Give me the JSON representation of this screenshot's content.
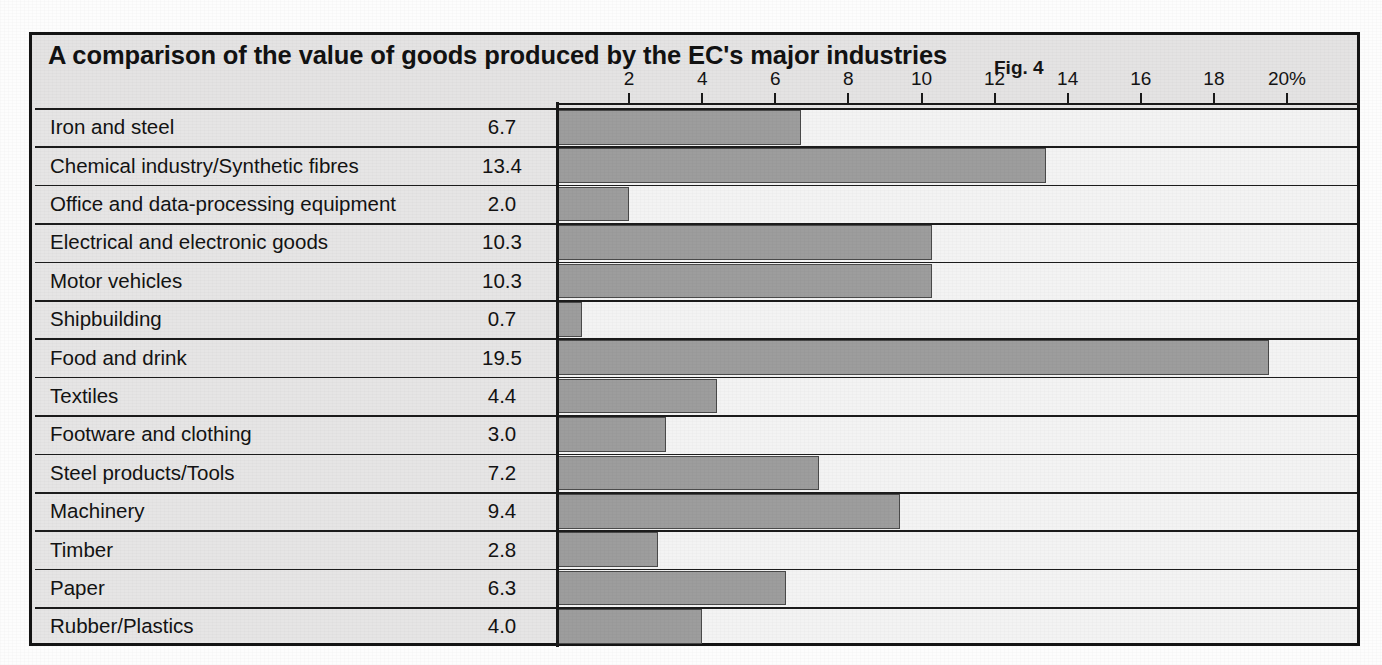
{
  "figure": {
    "title": "A comparison of the value of goods produced  by the EC's major industries",
    "fig_label": "Fig. 4",
    "axis_unit_suffix": "%"
  },
  "colors": {
    "bar_fill": "#9d9d9d",
    "bar_stroke": "#4a4a4a",
    "plot_background": "#f3f3f3",
    "label_background": "#e6e5e5",
    "title_background": "#e4e3e3",
    "frame_border": "#141414",
    "text": "#131313"
  },
  "chart_data": {
    "type": "bar",
    "orientation": "horizontal",
    "title": "A comparison of the value of goods produced  by the EC's major industries",
    "subtitle": "Fig. 4",
    "xlabel": "",
    "ylabel": "",
    "xlim": [
      0,
      20
    ],
    "grid": false,
    "legend": false,
    "value_label_position": "left-column",
    "tick_labels": [
      "2",
      "4",
      "6",
      "8",
      "10",
      "12",
      "14",
      "16",
      "18",
      "20%"
    ],
    "tick_values": [
      2,
      4,
      6,
      8,
      10,
      12,
      14,
      16,
      18,
      20
    ],
    "categories": [
      "Iron and steel",
      "Chemical industry/Synthetic fibres",
      "Office and data-processing equipment",
      "Electrical and electronic goods",
      "Motor vehicles",
      "Shipbuilding",
      "Food and drink",
      "Textiles",
      "Footware and clothing",
      "Steel products/Tools",
      "Machinery",
      "Timber",
      "Paper",
      "Rubber/Plastics"
    ],
    "values": [
      6.7,
      13.4,
      2.0,
      10.3,
      10.3,
      0.7,
      19.5,
      4.4,
      3.0,
      7.2,
      9.4,
      2.8,
      6.3,
      4.0
    ],
    "value_labels": [
      "6.7",
      "13.4",
      "2.0",
      "10.3",
      "10.3",
      "0.7",
      "19.5",
      "4.4",
      "3.0",
      "7.2",
      "9.4",
      "2.8",
      "6.3",
      "4.0"
    ]
  }
}
